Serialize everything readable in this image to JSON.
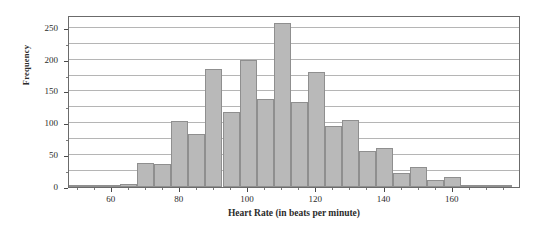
{
  "chart_data": {
    "type": "bar",
    "title": "",
    "subtitle": "",
    "xlabel": "Heart Rate (in beats per minute)",
    "ylabel": "Frequency",
    "xlim": [
      47.5,
      180
    ],
    "ylim": [
      0,
      270
    ],
    "grid": true,
    "legend": null,
    "bin_width": 5,
    "x_tick_labels": [
      "60",
      "80",
      "100",
      "120",
      "140",
      "160"
    ],
    "x_tick_values": [
      60,
      80,
      100,
      120,
      140,
      160
    ],
    "x_minor_tick_values": [
      50,
      55,
      65,
      70,
      75,
      85,
      90,
      95,
      105,
      110,
      115,
      125,
      130,
      135,
      145,
      150,
      155,
      165,
      170,
      175
    ],
    "y_tick_labels": [
      "0",
      "50",
      "100",
      "150",
      "200",
      "250"
    ],
    "y_tick_values": [
      0,
      50,
      100,
      150,
      200,
      250
    ],
    "y_minor_gridline_values": [
      25,
      75,
      125,
      175,
      225
    ],
    "bin_starts": [
      47.5,
      52.5,
      57.5,
      62.5,
      67.5,
      72.5,
      77.5,
      82.5,
      87.5,
      92.5,
      97.5,
      102.5,
      107.5,
      112.5,
      117.5,
      122.5,
      127.5,
      132.5,
      137.5,
      142.5,
      147.5,
      152.5,
      157.5,
      162.5,
      167.5,
      172.5
    ],
    "categories": [
      "47.5-52.5",
      "52.5-57.5",
      "57.5-62.5",
      "62.5-67.5",
      "67.5-72.5",
      "72.5-77.5",
      "77.5-82.5",
      "82.5-87.5",
      "87.5-92.5",
      "92.5-97.5",
      "97.5-102.5",
      "102.5-107.5",
      "107.5-112.5",
      "112.5-117.5",
      "117.5-122.5",
      "122.5-127.5",
      "127.5-132.5",
      "132.5-137.5",
      "137.5-142.5",
      "142.5-147.5",
      "147.5-152.5",
      "152.5-157.5",
      "157.5-162.5",
      "162.5-167.5",
      "167.5-172.5",
      "172.5-177.5"
    ],
    "values": [
      3,
      2,
      2,
      4,
      38,
      36,
      104,
      83,
      185,
      117,
      200,
      138,
      258,
      134,
      180,
      96,
      105,
      56,
      61,
      22,
      32,
      11,
      15,
      2,
      1,
      2
    ],
    "bar_color": "#b9b9b9",
    "bar_edge_color": "#8f8f8f",
    "gridline_color": "#b5b5b5",
    "frame_color": "#6b6b6b"
  }
}
